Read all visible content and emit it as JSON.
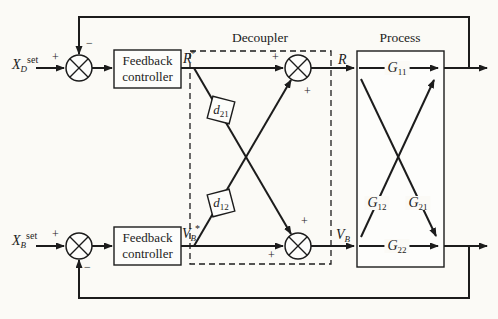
{
  "sections": {
    "decoupler": "Decoupler",
    "process": "Process"
  },
  "signs": {
    "plus": "+",
    "minus": "−"
  },
  "inputs": {
    "top": {
      "var": "X",
      "sub": "D",
      "sup": "set"
    },
    "bottom": {
      "var": "X",
      "sub": "B",
      "sup": "set"
    }
  },
  "controllers": {
    "top": {
      "line1": "Feedback",
      "line2": "controller"
    },
    "bottom": {
      "line1": "Feedback",
      "line2": "controller"
    }
  },
  "signals": {
    "r_setpoint": {
      "var": "R",
      "sup": "*"
    },
    "vb_setpoint": {
      "var": "V",
      "sub": "B",
      "sup": "*"
    },
    "r_out": {
      "var": "R"
    },
    "vb_out": {
      "var": "V",
      "sub": "B"
    }
  },
  "decoupler_blocks": {
    "d21": {
      "var": "d",
      "sub": "21"
    },
    "d12": {
      "var": "d",
      "sub": "12"
    }
  },
  "process_blocks": {
    "g11": {
      "var": "G",
      "sub": "11"
    },
    "g12": {
      "var": "G",
      "sub": "12"
    },
    "g21": {
      "var": "G",
      "sub": "21"
    },
    "g22": {
      "var": "G",
      "sub": "22"
    }
  },
  "colors": {
    "line": "#1c1c1c",
    "background": "#fbfaf6"
  }
}
